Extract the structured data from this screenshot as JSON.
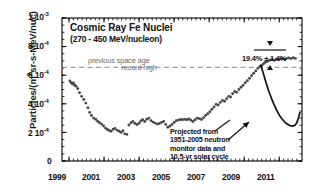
{
  "chart_data": {
    "type": "scatter",
    "title": "Cosmic Ray Fe Nuclei",
    "subtitle": "(270 - 450 MeV/nucleon)",
    "xlabel": "",
    "ylabel": "Particles/(m²sr-s-MeV/nuc)",
    "ylabel_prefix": "Particles/(m",
    "ylabel_sup": "2",
    "ylabel_suffix": "sr-s-MeV/nuc)",
    "xlim": [
      1998.6,
      2012.3
    ],
    "ylim": [
      0,
      0.001
    ],
    "grid": false,
    "legend_position": "none",
    "x_ticks": [
      "1999",
      "2001",
      "2003",
      "2005",
      "2007",
      "2009",
      "2011"
    ],
    "x_tick_values": [
      1999,
      2001,
      2003,
      2005,
      2007,
      2009,
      2011
    ],
    "y_ticks": [
      {
        "value": 0.0,
        "mantissa": "0",
        "exponent": ""
      },
      {
        "value": 0.0002,
        "mantissa": "2 10",
        "exponent": "-4"
      },
      {
        "value": 0.0004,
        "mantissa": "4 10",
        "exponent": "-4"
      },
      {
        "value": 0.0006,
        "mantissa": "6 10",
        "exponent": "-4"
      },
      {
        "value": 0.0008,
        "mantissa": "8 10",
        "exponent": "-4"
      },
      {
        "value": 0.001,
        "mantissa": "1 10",
        "exponent": "-3"
      }
    ],
    "reference_line": {
      "value": 0.000655,
      "label_line1": "previous space age",
      "label_line2": "record high",
      "style": "dashed",
      "color": "#8a8a8a"
    },
    "annotation_percent": {
      "text": "19.4% ± 1.4%",
      "value_percent": 19.4,
      "error_percent": 1.4
    },
    "annotation_projection": {
      "line1": "Projected from",
      "line2": "1951-2005 neutron",
      "line3": "monitor data and",
      "line4": "10.5-yr solar cycle"
    },
    "series": [
      {
        "name": "measured",
        "marker": "circle",
        "color": "#4a4a4a",
        "points": [
          [
            1999.05,
            0.00056
          ],
          [
            1999.12,
            0.000548
          ],
          [
            1999.19,
            0.000538
          ],
          [
            1999.26,
            0.000545
          ],
          [
            1999.33,
            0.00053
          ],
          [
            1999.4,
            0.000522
          ],
          [
            1999.5,
            0.000505
          ],
          [
            1999.6,
            0.000478
          ],
          [
            1999.72,
            0.000452
          ],
          [
            1999.84,
            0.00043
          ],
          [
            1999.96,
            0.000405
          ],
          [
            2000.08,
            0.000372
          ],
          [
            2000.18,
            0.00034
          ],
          [
            2000.28,
            0.000318
          ],
          [
            2000.4,
            0.0003
          ],
          [
            2000.52,
            0.000292
          ],
          [
            2000.63,
            0.000278
          ],
          [
            2000.74,
            0.000268
          ],
          [
            2000.86,
            0.000258
          ],
          [
            2000.97,
            0.000245
          ],
          [
            2001.08,
            0.00023
          ],
          [
            2001.18,
            0.000222
          ],
          [
            2001.28,
            0.000214
          ],
          [
            2001.4,
            0.000208
          ],
          [
            2001.52,
            0.000222
          ],
          [
            2001.62,
            0.000228
          ],
          [
            2001.74,
            0.000216
          ],
          [
            2001.86,
            0.000208
          ],
          [
            2001.97,
            0.0002
          ],
          [
            2002.08,
            0.000212
          ],
          [
            2002.18,
            0.00019
          ],
          [
            2002.3,
            0.000186
          ],
          [
            2002.42,
            0.000252
          ],
          [
            2002.54,
            0.000268
          ],
          [
            2002.65,
            0.000276
          ],
          [
            2002.76,
            0.000262
          ],
          [
            2002.88,
            0.000255
          ],
          [
            2003.0,
            0.000264
          ],
          [
            2003.1,
            0.00028
          ],
          [
            2003.2,
            0.000288
          ],
          [
            2003.32,
            0.000276
          ],
          [
            2003.44,
            0.000292
          ],
          [
            2003.56,
            0.0003
          ],
          [
            2003.68,
            0.000282
          ],
          [
            2003.8,
            0.000272
          ],
          [
            2003.92,
            0.000265
          ],
          [
            2004.04,
            0.000258
          ],
          [
            2004.16,
            0.000262
          ],
          [
            2004.28,
            0.00027
          ],
          [
            2004.4,
            0.000276
          ],
          [
            2004.52,
            0.000256
          ],
          [
            2004.64,
            0.000236
          ],
          [
            2004.76,
            0.000244
          ],
          [
            2004.88,
            0.000256
          ],
          [
            2005.0,
            0.00027
          ],
          [
            2005.12,
            0.000282
          ],
          [
            2005.24,
            0.000286
          ],
          [
            2005.36,
            0.00029
          ],
          [
            2005.48,
            0.000288
          ],
          [
            2005.6,
            0.000292
          ],
          [
            2005.72,
            0.000288
          ],
          [
            2005.84,
            0.000294
          ],
          [
            2005.96,
            0.000285
          ],
          [
            2006.08,
            0.000276
          ],
          [
            2006.2,
            0.000288
          ],
          [
            2006.32,
            0.0003
          ],
          [
            2006.44,
            0.000296
          ],
          [
            2006.56,
            0.00029
          ],
          [
            2006.68,
            0.000302
          ],
          [
            2006.8,
            0.000318
          ],
          [
            2006.92,
            0.00033
          ],
          [
            2007.04,
            0.000344
          ],
          [
            2007.16,
            0.000362
          ],
          [
            2007.28,
            0.000378
          ],
          [
            2007.4,
            0.000396
          ],
          [
            2007.52,
            0.000392
          ],
          [
            2007.64,
            0.00041
          ],
          [
            2007.76,
            0.000424
          ],
          [
            2007.88,
            0.000418
          ],
          [
            2008.0,
            0.000436
          ],
          [
            2008.12,
            0.000452
          ],
          [
            2008.22,
            0.000448
          ],
          [
            2008.34,
            0.00047
          ],
          [
            2008.46,
            0.000486
          ],
          [
            2008.58,
            0.00048
          ],
          [
            2008.7,
            0.0005
          ],
          [
            2008.82,
            0.000516
          ],
          [
            2008.94,
            0.00053
          ],
          [
            2009.06,
            0.000548
          ],
          [
            2009.18,
            0.000562
          ],
          [
            2009.3,
            0.000578
          ],
          [
            2009.42,
            0.000596
          ],
          [
            2009.54,
            0.000614
          ],
          [
            2009.66,
            0.00063
          ],
          [
            2009.78,
            0.000648
          ],
          [
            2009.9,
            0.000662
          ],
          [
            2010.0,
            0.000668
          ],
          [
            2010.1,
            0.00068
          ],
          [
            2010.2,
            0.00069
          ],
          [
            2010.3,
            0.000696
          ],
          [
            2010.4,
            0.000702
          ],
          [
            2010.5,
            0.000706
          ],
          [
            2010.6,
            0.00071
          ],
          [
            2010.72,
            0.000704
          ],
          [
            2010.84,
            0.000712
          ],
          [
            2010.96,
            0.000708
          ],
          [
            2011.08,
            0.000714
          ],
          [
            2011.2,
            0.000716
          ],
          [
            2011.32,
            0.000712
          ],
          [
            2011.44,
            0.000718
          ],
          [
            2011.56,
            0.00072
          ],
          [
            2011.68,
            0.000716
          ],
          [
            2011.8,
            0.000722
          ],
          [
            2011.92,
            0.000718
          ]
        ]
      },
      {
        "name": "projected",
        "marker": "line",
        "color": "#111111",
        "points": [
          [
            2009.95,
            0.00067
          ],
          [
            2010.1,
            0.00061
          ],
          [
            2010.25,
            0.000548
          ],
          [
            2010.4,
            0.00049
          ],
          [
            2010.55,
            0.00044
          ],
          [
            2010.7,
            0.000396
          ],
          [
            2010.85,
            0.000356
          ],
          [
            2011.0,
            0.000322
          ],
          [
            2011.15,
            0.000296
          ],
          [
            2011.3,
            0.000274
          ],
          [
            2011.45,
            0.000258
          ],
          [
            2011.6,
            0.000248
          ],
          [
            2011.75,
            0.000244
          ],
          [
            2011.9,
            0.00025
          ],
          [
            2012.0,
            0.000268
          ],
          [
            2012.1,
            0.0003
          ],
          [
            2012.18,
            0.00034
          ]
        ]
      }
    ]
  }
}
